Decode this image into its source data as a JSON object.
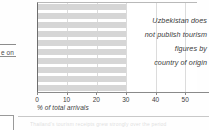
{
  "page_fragments": {
    "left_text": "e on",
    "bottom_text": "Thailand's tourism receipts grew strongly over the period",
    "left_box_name": "cropped-table-cell",
    "bottom_box_name": "cropped-figure-marker"
  },
  "chart_data": {
    "type": "bar",
    "orientation": "horizontal",
    "title": "",
    "xlabel": "% of total arrivals",
    "ylabel": "",
    "xlim": [
      0,
      54
    ],
    "grid": true,
    "legend": false,
    "xticks": [
      0,
      10,
      20,
      30,
      40,
      50
    ],
    "xtick_labels": [
      "0",
      "10",
      "20",
      "30",
      "40",
      "50"
    ],
    "categories": [
      "",
      "",
      "",
      "",
      "",
      "",
      "",
      "",
      "",
      ""
    ],
    "values": [
      30,
      30,
      30,
      30,
      30,
      30,
      30,
      30,
      30,
      30
    ],
    "bar_color": "#d6d6d6",
    "annotation": {
      "lines": [
        "Uzbekistan does",
        "not publish tourism",
        "figures by",
        "country of origin"
      ],
      "style": "italic",
      "align": "right"
    }
  },
  "colors": {
    "bar": "#d6d6d6",
    "gridline": "#dcdcdc",
    "axis": "#8a8a8a",
    "text": "#3d3d3d",
    "background": "#ffffff"
  }
}
